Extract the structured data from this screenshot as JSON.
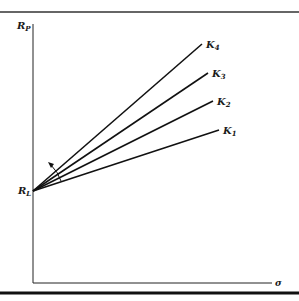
{
  "diagram": {
    "title": "",
    "y_axis": {
      "label": "R",
      "label_sub": "P"
    },
    "x_axis": {
      "label": "σ"
    },
    "origin_label": {
      "main": "R",
      "sub": "L"
    },
    "lines": [
      {
        "id": "K4",
        "main": "K",
        "sub": "4"
      },
      {
        "id": "K3",
        "main": "K",
        "sub": "3"
      },
      {
        "id": "K2",
        "main": "K",
        "sub": "2"
      },
      {
        "id": "K1",
        "main": "K",
        "sub": "1"
      }
    ],
    "annotation": "rotation-arrow (counter-clockwise, increasing slope)",
    "colors": {
      "ink": "#1a1a1a",
      "background": "#ffffff"
    }
  }
}
